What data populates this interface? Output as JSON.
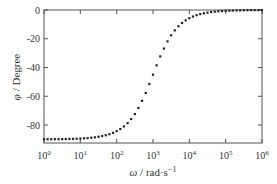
{
  "chart_data": {
    "type": "scatter",
    "title": "",
    "xlabel": "ω / rad·s⁻¹",
    "xlabel_parts": {
      "symbol": "ω",
      "unit": " / rad·s",
      "exp": "−1"
    },
    "ylabel": "φ / Degree",
    "ylabel_parts": {
      "symbol": "φ",
      "unit": " / Degree"
    },
    "xscale": "log",
    "xlim": [
      1,
      1000000
    ],
    "ylim": [
      -92.5,
      2
    ],
    "x_ticks": [
      {
        "base": "10",
        "exp": "0",
        "value": 1
      },
      {
        "base": "10",
        "exp": "1",
        "value": 10
      },
      {
        "base": "10",
        "exp": "2",
        "value": 100
      },
      {
        "base": "10",
        "exp": "3",
        "value": 1000
      },
      {
        "base": "10",
        "exp": "4",
        "value": 10000
      },
      {
        "base": "10",
        "exp": "5",
        "value": 100000
      },
      {
        "base": "10",
        "exp": "6",
        "value": 1000000
      }
    ],
    "y_ticks": [
      {
        "label": "0",
        "value": 0
      },
      {
        "label": "-20",
        "value": -20
      },
      {
        "label": "-40",
        "value": -40
      },
      {
        "label": "-60",
        "value": -60
      },
      {
        "label": "-80",
        "value": -80
      }
    ],
    "grid": false,
    "legend": null,
    "marker": "square",
    "marker_color": "#222222",
    "series": [
      {
        "name": "phase",
        "description": "phi = -arctan(1000/omega), 10 points per decade",
        "x_log10": [
          0.0,
          0.1,
          0.2,
          0.3,
          0.4,
          0.5,
          0.6,
          0.7,
          0.8,
          0.9,
          1.0,
          1.1,
          1.2,
          1.3,
          1.4,
          1.5,
          1.6,
          1.7,
          1.8,
          1.9,
          2.0,
          2.1,
          2.2,
          2.3,
          2.4,
          2.5,
          2.6,
          2.7,
          2.8,
          2.9,
          3.0,
          3.1,
          3.2,
          3.3,
          3.4,
          3.5,
          3.6,
          3.7,
          3.8,
          3.9,
          4.0,
          4.1,
          4.2,
          4.3,
          4.4,
          4.5,
          4.6,
          4.7,
          4.8,
          4.9,
          5.0,
          5.1,
          5.2,
          5.3,
          5.4,
          5.5,
          5.6,
          5.7,
          5.8,
          5.9,
          6.0
        ],
        "values": [
          -89.94,
          -89.93,
          -89.91,
          -89.89,
          -89.86,
          -89.82,
          -89.77,
          -89.71,
          -89.64,
          -89.55,
          -89.43,
          -89.28,
          -89.09,
          -88.86,
          -88.56,
          -88.19,
          -87.72,
          -87.14,
          -86.4,
          -85.47,
          -84.29,
          -82.82,
          -80.98,
          -78.69,
          -75.85,
          -72.36,
          -68.14,
          -63.18,
          -57.72,
          -51.48,
          -45.0,
          -38.52,
          -32.28,
          -26.82,
          -21.86,
          -17.64,
          -14.15,
          -11.31,
          -9.02,
          -7.18,
          -5.71,
          -4.53,
          -3.6,
          -2.86,
          -2.28,
          -1.81,
          -1.44,
          -1.14,
          -0.91,
          -0.72,
          -0.57,
          -0.45,
          -0.36,
          -0.29,
          -0.23,
          -0.18,
          -0.14,
          -0.11,
          -0.09,
          -0.07,
          -0.06
        ]
      }
    ]
  }
}
